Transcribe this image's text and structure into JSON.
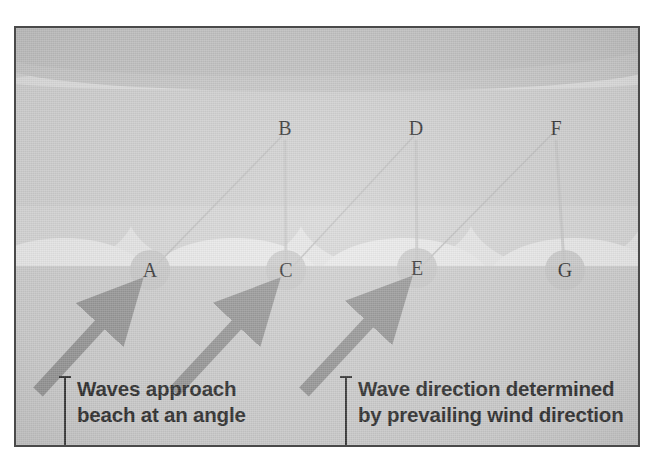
{
  "figure": {
    "frame_border_color": "#4a4a4a",
    "background_color": "#cfcfcf"
  },
  "zones": [
    {
      "name": "deep-water",
      "label": "deep water",
      "color": "#c3c3c3"
    },
    {
      "name": "open-water",
      "label": "open water",
      "color": "#cdcdcd"
    },
    {
      "name": "surf-zone",
      "label": "surf zone",
      "color": "#e4e4e4"
    },
    {
      "name": "beach",
      "label": "beach",
      "color": "#cacaca"
    }
  ],
  "points": [
    {
      "id": "A",
      "label": "A",
      "x": 148,
      "y": 268,
      "circled": true,
      "zone": "beach"
    },
    {
      "id": "B",
      "label": "B",
      "x": 283,
      "y": 126,
      "circled": false,
      "zone": "open-water"
    },
    {
      "id": "C",
      "label": "C",
      "x": 284,
      "y": 268,
      "circled": true,
      "zone": "beach"
    },
    {
      "id": "D",
      "label": "D",
      "x": 414,
      "y": 126,
      "circled": false,
      "zone": "open-water"
    },
    {
      "id": "E",
      "label": "E",
      "x": 415,
      "y": 266,
      "circled": true,
      "zone": "beach"
    },
    {
      "id": "F",
      "label": "F",
      "x": 554,
      "y": 126,
      "circled": false,
      "zone": "open-water"
    },
    {
      "id": "G",
      "label": "G",
      "x": 563,
      "y": 268,
      "circled": true,
      "zone": "beach"
    }
  ],
  "arrows": {
    "color": "#8c8c8c",
    "direction": "up-right",
    "count": 3,
    "items": [
      {
        "name": "wave-arrow-1",
        "x1": 36,
        "y1": 390,
        "x2": 124,
        "y2": 298
      },
      {
        "name": "wave-arrow-2",
        "x1": 172,
        "y1": 390,
        "x2": 262,
        "y2": 298
      },
      {
        "name": "wave-arrow-3",
        "x1": 302,
        "y1": 390,
        "x2": 392,
        "y2": 296
      }
    ]
  },
  "rays": {
    "color": "#b4b4b4",
    "description": "faint zig-zag wave ray paths from beach points up to open-water points"
  },
  "captions": [
    {
      "name": "caption-left",
      "text": "Waves approach\nbeach at an angle",
      "line1": "Waves approach",
      "line2": "beach at an angle",
      "x": 62,
      "y": 374
    },
    {
      "name": "caption-right",
      "text": "Wave direction determined\nby prevailing wind direction",
      "line1": "Wave direction determined",
      "line2": "by prevailing wind direction",
      "x": 343,
      "y": 374
    }
  ]
}
